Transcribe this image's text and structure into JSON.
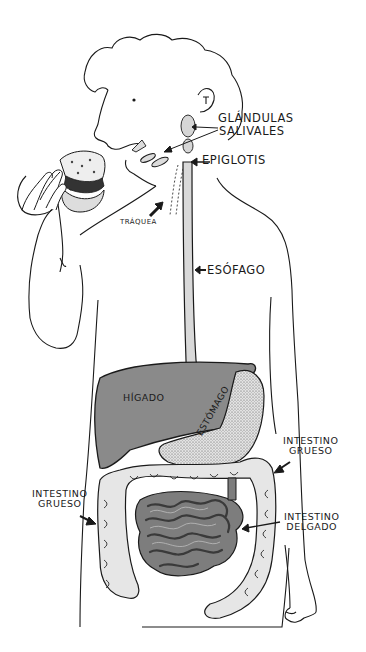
{
  "diagram": {
    "labels": {
      "glandulas_salivales_1": "GLÁNDULAS",
      "glandulas_salivales_2": "SALIVALES",
      "epiglotis": "EPIGLOTIS",
      "traquea": "TRÁQUEA",
      "esofago": "ESÓFAGO",
      "higado": "HÍGADO",
      "estomago": "ESTÓMAGO",
      "intestino_grueso_right_1": "INTESTINO",
      "intestino_grueso_right_2": "GRUESO",
      "intestino_grueso_left_1": "INTESTINO",
      "intestino_grueso_left_2": "GRUESO",
      "intestino_delgado_1": "INTESTINO",
      "intestino_delgado_2": "DELGADO"
    },
    "colors": {
      "line": "#1a1a1a",
      "liver": "#8a8a8a",
      "stomach": "#cfcfcf",
      "small_intestine": "#7d7d7d",
      "large_intestine": "#e6e6e6",
      "esophagus": "#d9d9d9",
      "glands": "#d6d6d6",
      "background": "#ffffff"
    }
  }
}
